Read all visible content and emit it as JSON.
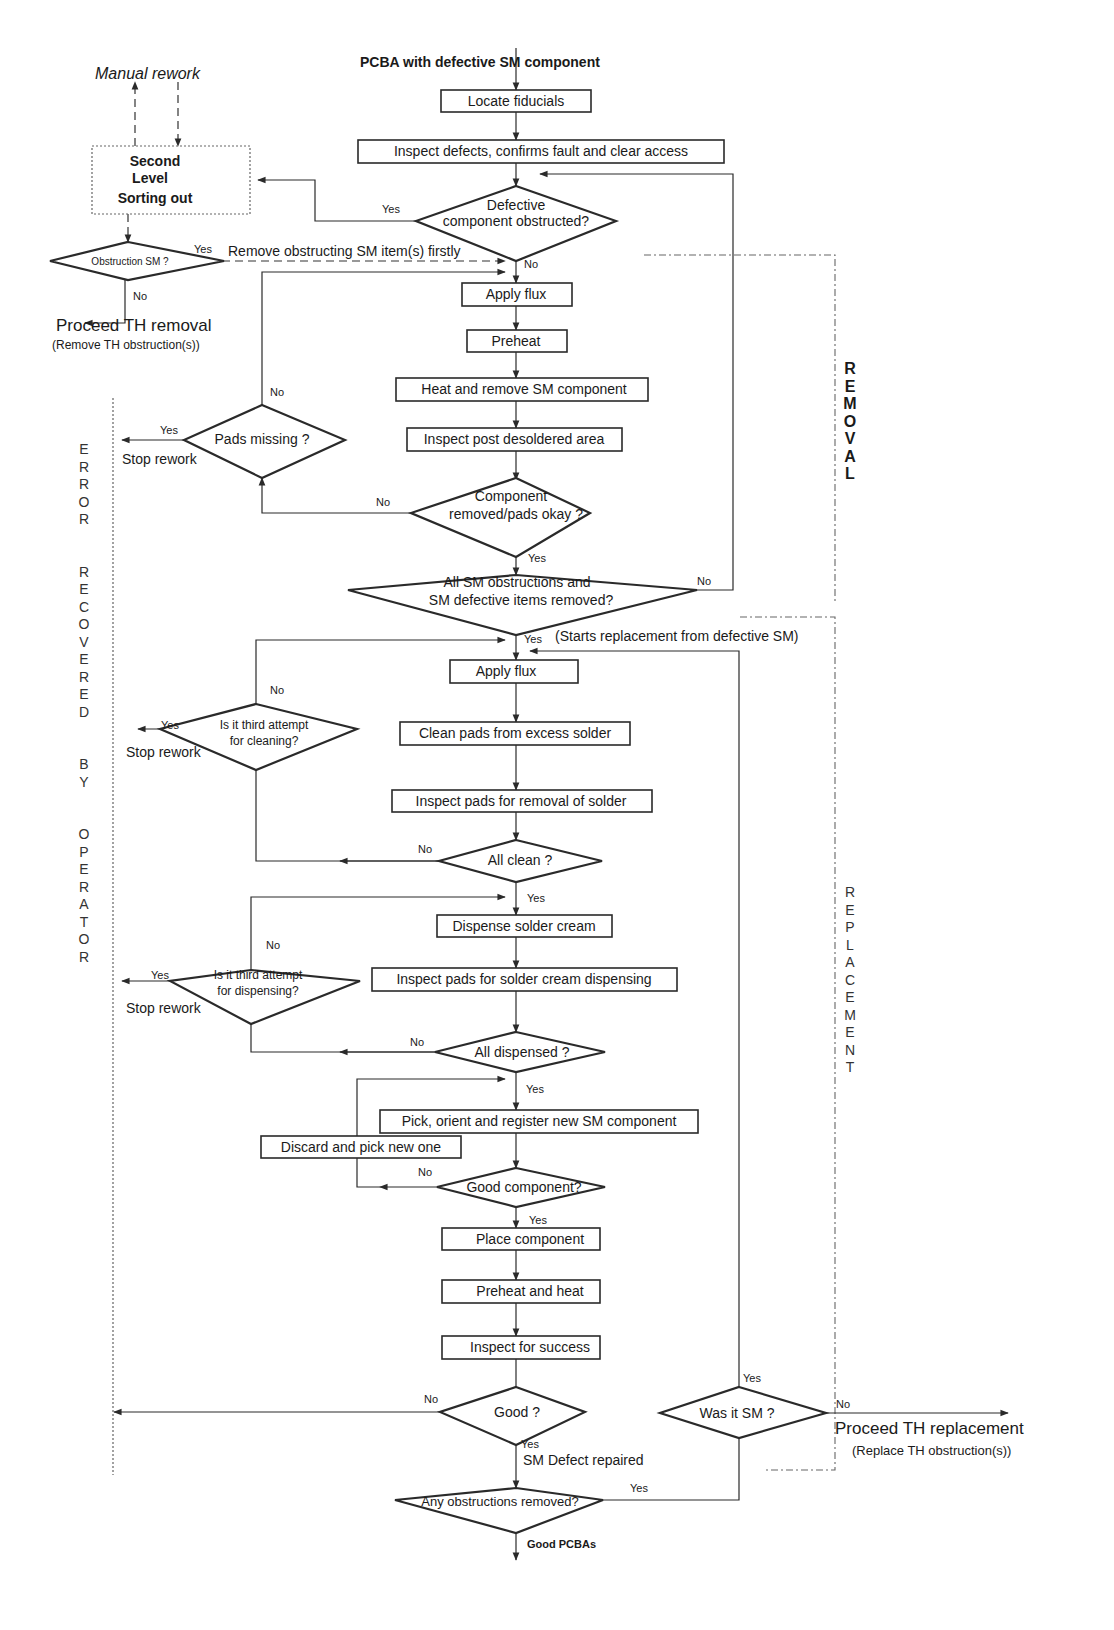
{
  "title": "PCBA with defective SM component",
  "side_labels": {
    "removal": "R\nE\nM\nO\nV\nA\nL",
    "replacement": "R\nE\nP\nL\nA\nC\nE\nM\nE\nN\nT",
    "error_recovered": "E\nR\nR\nO\nR\n\n\nR\nE\nC\nO\nV\nE\nR\nE\nD\n\n\nB\nY\n\n\nO\nP\nE\nR\nA\nT\nO\nR"
  },
  "left_panel": {
    "manual_rework": "Manual rework",
    "second_level": [
      "Second",
      "Level",
      "Sorting out"
    ],
    "obstruction_sm": "Obstruction SM ?",
    "remove_obstructing": "Remove obstructing SM  item(s) firstly",
    "proceed_th_removal": "Proceed TH removal",
    "remove_th_obstructions": "(Remove TH obstruction(s))"
  },
  "removal_steps": {
    "locate_fiducials": "Locate fiducials",
    "inspect_defects": "Inspect defects, confirms fault and clear access",
    "defective_obstructed": [
      "Defective",
      "component obstructed?"
    ],
    "apply_flux": "Apply flux",
    "preheat": "Preheat",
    "heat_remove": "Heat and remove SM component",
    "inspect_post": "Inspect post desoldered area",
    "component_removed": [
      "Component",
      "removed/pads okay ?"
    ],
    "pads_missing": "Pads missing ?",
    "all_removed": [
      "All SM obstructions and",
      "SM defective items removed?"
    ]
  },
  "replacement_steps": {
    "starts_replacement": "(Starts replacement  from defective SM)",
    "apply_flux": "Apply flux",
    "clean_pads": "Clean pads from excess solder",
    "inspect_pads_removal": "Inspect pads for removal of solder",
    "all_clean": "All clean ?",
    "third_attempt_cleaning": [
      "Is it third attempt",
      "for cleaning?"
    ],
    "dispense_cream": "Dispense solder cream",
    "inspect_pads_cream": "Inspect pads for solder cream dispensing",
    "third_attempt_dispensing": [
      "Is it third attempt",
      "for dispensing?"
    ],
    "all_dispensed": "All dispensed ?",
    "pick_orient": "Pick, orient and register new SM  component",
    "discard_pick": "Discard and pick new one",
    "good_component": "Good component?",
    "place_component": "Place component",
    "preheat_heat": "Preheat and heat",
    "inspect_success": "Inspect for success",
    "good": "Good ?",
    "was_it_sm": "Was it SM ?",
    "sm_defect_repaired": "SM Defect repaired",
    "any_obstructions": "Any obstructions removed?",
    "good_pcbas": "Good PCBAs",
    "proceed_th_replacement": "Proceed TH replacement",
    "replace_th_obstructions": "(Replace TH obstruction(s))"
  },
  "edge_labels": {
    "yes": "Yes",
    "no": "No",
    "stop_rework": "Stop rework"
  }
}
